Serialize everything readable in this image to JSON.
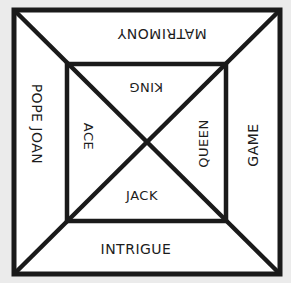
{
  "board": {
    "title": "Pope Joan board",
    "colors": {
      "background": "#ebebeb",
      "fill": "#ffffff",
      "line": "#1a1a1a"
    },
    "outer_square": {
      "x1": 14,
      "y1": 10,
      "x2": 280,
      "y2": 274
    },
    "inner_square": {
      "x1": 67,
      "y1": 64,
      "x2": 226,
      "y2": 221
    }
  },
  "outer_sections": {
    "top": "MATRIMONY",
    "left": "POPE JOAN",
    "right": "GAME",
    "bottom": "INTRIGUE"
  },
  "inner_sections": {
    "top": "KING",
    "left": "ACE",
    "right": "QUEEN",
    "bottom": "JACK"
  }
}
